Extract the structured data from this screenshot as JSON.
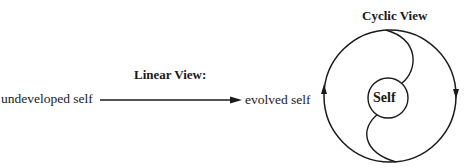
{
  "linear_view": {
    "title": "Linear View:",
    "start_label": "undeveloped self",
    "end_label": "evolved self"
  },
  "cyclic_view": {
    "title": "Cyclic View",
    "center_label": "Self",
    "left_arrow_direction": "up",
    "right_arrow_direction": "down"
  },
  "colors": {
    "stroke": "#1a1a1a",
    "background": "#ffffff"
  }
}
